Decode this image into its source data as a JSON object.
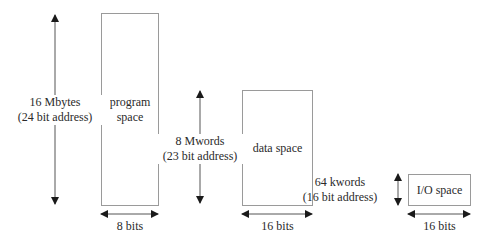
{
  "diagram": {
    "program": {
      "box_label_line1": "program",
      "box_label_line2": "space",
      "size_line1": "16 Mbytes",
      "size_line2": "(24 bit address)",
      "width_label": "8 bits"
    },
    "data": {
      "box_label": "data space",
      "size_line1": "8 Mwords",
      "size_line2": "(23 bit address)",
      "width_label": "16 bits"
    },
    "io": {
      "box_label": "I/O space",
      "size_line1": "64 kwords",
      "size_line2": "(16 bit address)",
      "width_label": "16 bits"
    },
    "colors": {
      "box_border": "#9a9a9a",
      "arrow": "#1a1a1a",
      "text": "#2a2a2a"
    }
  }
}
